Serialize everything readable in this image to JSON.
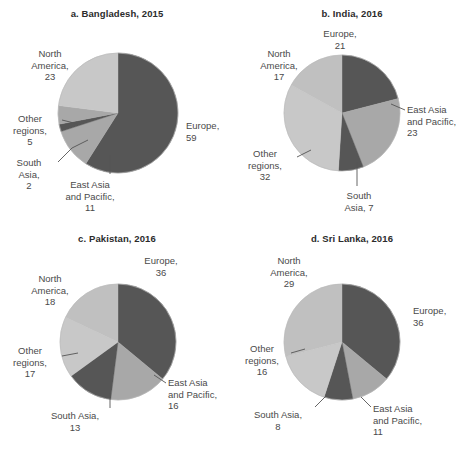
{
  "figure": {
    "background": "#ffffff",
    "palette": {
      "dark": "#565656",
      "mid": "#a8a8a8",
      "light": "#c8c8c8",
      "light2": "#c0c0c0",
      "leader": "#555555",
      "text": "#4a4a4a",
      "title": "#2b2b2b"
    }
  },
  "chart_data": [
    {
      "type": "pie",
      "id": "a",
      "title": "a. Bangladesh, 2015",
      "categories": [
        "Europe",
        "East Asia and Pacific",
        "South Asia",
        "Other regions",
        "North America"
      ],
      "values": [
        59,
        11,
        2,
        5,
        23
      ],
      "colors": [
        "#565656",
        "#a8a8a8",
        "#565656",
        "#a8a8a8",
        "#c8c8c8"
      ],
      "start_angle": 0,
      "direction": "clockwise",
      "labels": [
        {
          "name": "europe",
          "text": "Europe,\n59"
        },
        {
          "name": "east-asia-and-pacific",
          "text": "East Asia\nand Pacific,\n11"
        },
        {
          "name": "south-asia",
          "text": "South\nAsia,\n2"
        },
        {
          "name": "other-regions",
          "text": "Other\nregions,\n5"
        },
        {
          "name": "north-america",
          "text": "North\nAmerica,\n23"
        }
      ]
    },
    {
      "type": "pie",
      "id": "b",
      "title": "b. India, 2016",
      "categories": [
        "Europe",
        "East Asia and Pacific",
        "South Asia",
        "Other regions",
        "North America"
      ],
      "values": [
        21,
        23,
        7,
        32,
        17
      ],
      "colors": [
        "#565656",
        "#a8a8a8",
        "#565656",
        "#c8c8c8",
        "#c0c0c0"
      ],
      "start_angle": 0,
      "direction": "clockwise",
      "labels": [
        {
          "name": "europe",
          "text": "Europe,\n21"
        },
        {
          "name": "east-asia-and-pacific",
          "text": "East Asia\nand Pacific,\n23"
        },
        {
          "name": "south-asia",
          "text": "South\nAsia, 7"
        },
        {
          "name": "other-regions",
          "text": "Other\nregions,\n32"
        },
        {
          "name": "north-america",
          "text": "North\nAmerica,\n17"
        }
      ]
    },
    {
      "type": "pie",
      "id": "c",
      "title": "c. Pakistan, 2016",
      "categories": [
        "Europe",
        "East Asia and Pacific",
        "South Asia",
        "Other regions",
        "North America"
      ],
      "values": [
        36,
        16,
        13,
        17,
        18
      ],
      "colors": [
        "#565656",
        "#a8a8a8",
        "#565656",
        "#c8c8c8",
        "#c0c0c0"
      ],
      "start_angle": 0,
      "direction": "clockwise",
      "labels": [
        {
          "name": "europe",
          "text": "Europe,\n36"
        },
        {
          "name": "east-asia-and-pacific",
          "text": "East Asia\nand Pacific,\n16"
        },
        {
          "name": "south-asia",
          "text": "South Asia,\n13"
        },
        {
          "name": "other-regions",
          "text": "Other\nregions,\n17"
        },
        {
          "name": "north-america",
          "text": "North\nAmerica,\n18"
        }
      ]
    },
    {
      "type": "pie",
      "id": "d",
      "title": "d. Sri Lanka, 2016",
      "categories": [
        "Europe",
        "East Asia and Pacific",
        "South Asia",
        "Other regions",
        "North America"
      ],
      "values": [
        36,
        11,
        8,
        16,
        29
      ],
      "colors": [
        "#565656",
        "#a8a8a8",
        "#565656",
        "#c8c8c8",
        "#c0c0c0"
      ],
      "start_angle": 0,
      "direction": "clockwise",
      "labels": [
        {
          "name": "europe",
          "text": "Europe,\n36"
        },
        {
          "name": "east-asia-and-pacific",
          "text": "East Asia\nand Pacific,\n11"
        },
        {
          "name": "south-asia",
          "text": "South Asia,\n8"
        },
        {
          "name": "other-regions",
          "text": "Other\nregions,\n16"
        },
        {
          "name": "north-america",
          "text": "North\nAmerica,\n29"
        }
      ]
    }
  ]
}
